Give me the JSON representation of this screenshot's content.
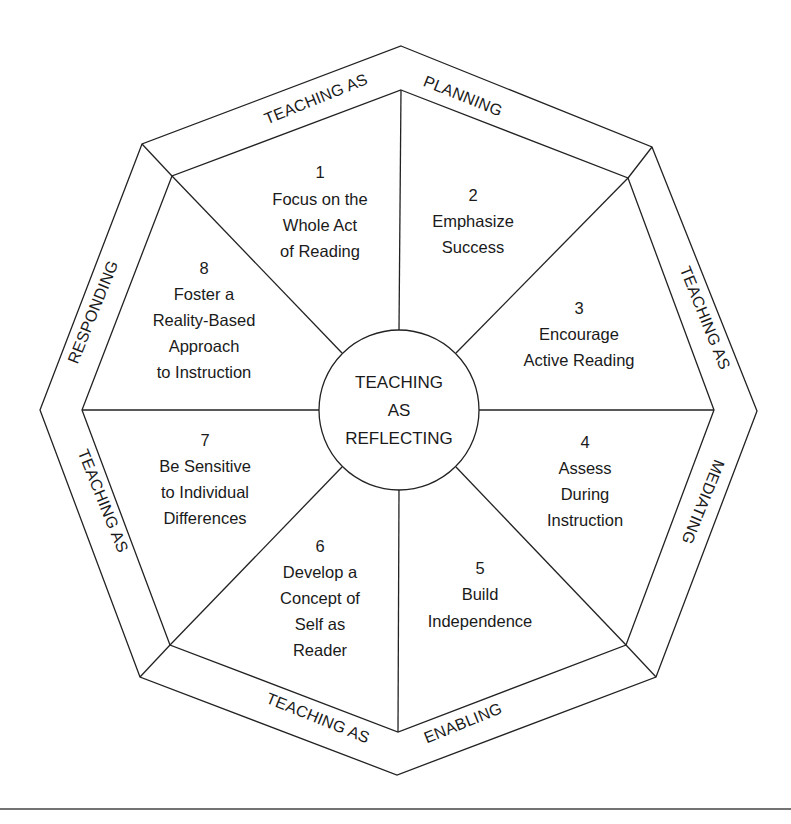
{
  "diagram": {
    "center": {
      "lines": [
        "TEACHING",
        "AS",
        "REFLECTING"
      ]
    },
    "segments": [
      {
        "number": "1",
        "lines": [
          "Focus on the",
          "Whole Act",
          "of Reading"
        ]
      },
      {
        "number": "2",
        "lines": [
          "Emphasize",
          "Success"
        ]
      },
      {
        "number": "3",
        "lines": [
          "Encourage",
          "Active Reading"
        ]
      },
      {
        "number": "4",
        "lines": [
          "Assess",
          "During",
          "Instruction"
        ]
      },
      {
        "number": "5",
        "lines": [
          "Build",
          "Independence"
        ]
      },
      {
        "number": "6",
        "lines": [
          "Develop a",
          "Concept of",
          "Self as",
          "Reader"
        ]
      },
      {
        "number": "7",
        "lines": [
          "Be Sensitive",
          "to Individual",
          "Differences"
        ]
      },
      {
        "number": "8",
        "lines": [
          "Foster a",
          "Reality-Based",
          "Approach",
          "to Instruction"
        ]
      }
    ],
    "bands": {
      "top": {
        "left": "TEACHING AS",
        "right": "PLANNING"
      },
      "right": {
        "upper": "TEACHING AS",
        "lower": "MEDIATING"
      },
      "bottom": {
        "left": "TEACHING AS",
        "right": "ENABLING"
      },
      "left": {
        "upper": "RESPONDING",
        "lower": "TEACHING AS"
      }
    },
    "colors": {
      "stroke": "#222222",
      "text": "#1a1a1a",
      "background": "#ffffff"
    }
  }
}
